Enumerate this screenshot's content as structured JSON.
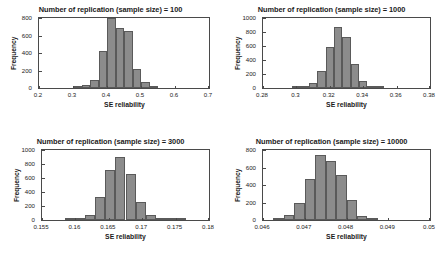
{
  "figure": {
    "panel_count": 4,
    "bar_color": "#8c8c8c",
    "bar_edge_color": "#5a5a5a",
    "axis_color": "#4a4a4a",
    "background": "#ffffff"
  },
  "chart_data": [
    {
      "type": "bar",
      "title": "Number of replication (sample size) = 100",
      "xlabel": "SE reliability",
      "ylabel": "Frequency",
      "xlim": [
        0.2,
        0.7
      ],
      "ylim": [
        0,
        800
      ],
      "grid": false,
      "legend": null,
      "xticks": [
        0.2,
        0.3,
        0.4,
        0.5,
        0.6,
        0.7
      ],
      "xticklabels": [
        "0.2",
        "0.3",
        "0.4",
        "0.5",
        "0.6",
        "0.7"
      ],
      "yticks": [
        0,
        200,
        400,
        600,
        800
      ],
      "yticklabels": [
        "0",
        "200",
        "400",
        "600",
        "800"
      ],
      "bin_edges": [
        0.3,
        0.325,
        0.35,
        0.375,
        0.4,
        0.425,
        0.45,
        0.475,
        0.5,
        0.525,
        0.55
      ],
      "values": [
        10,
        35,
        90,
        425,
        795,
        690,
        650,
        220,
        70,
        10
      ]
    },
    {
      "type": "bar",
      "title": "Number of replication (sample size) = 1000",
      "xlabel": "SE reliability",
      "ylabel": "Frequency",
      "xlim": [
        0.28,
        0.38
      ],
      "ylim": [
        0,
        1000
      ],
      "grid": false,
      "legend": null,
      "xticks": [
        0.28,
        0.3,
        0.32,
        0.34,
        0.36,
        0.38
      ],
      "xticklabels": [
        "0.28",
        "0.3",
        "0.32",
        "0.34",
        "0.36",
        "0.38"
      ],
      "yticks": [
        0,
        200,
        400,
        600,
        800,
        1000
      ],
      "yticklabels": [
        "0",
        "200",
        "400",
        "600",
        "800",
        "1000"
      ],
      "bin_edges": [
        0.2975,
        0.3025,
        0.3075,
        0.3125,
        0.3175,
        0.3225,
        0.3275,
        0.3325,
        0.3375,
        0.3425,
        0.3475,
        0.3525
      ],
      "values": [
        8,
        15,
        70,
        250,
        590,
        865,
        725,
        340,
        105,
        20,
        5
      ]
    },
    {
      "type": "bar",
      "title": "Number of replication (sample size) = 3000",
      "xlabel": "SE reliability",
      "ylabel": "Frequency",
      "xlim": [
        0.155,
        0.18
      ],
      "ylim": [
        0,
        1000
      ],
      "grid": false,
      "legend": null,
      "xticks": [
        0.155,
        0.16,
        0.165,
        0.17,
        0.175,
        0.18
      ],
      "xticklabels": [
        "0.155",
        "0.16",
        "0.165",
        "0.17",
        "0.175",
        "0.18"
      ],
      "yticks": [
        0,
        200,
        400,
        600,
        800,
        1000
      ],
      "yticklabels": [
        "0",
        "200",
        "400",
        "600",
        "800",
        "1000"
      ],
      "bin_edges": [
        0.1585,
        0.16,
        0.1615,
        0.163,
        0.1645,
        0.166,
        0.1675,
        0.169,
        0.1705,
        0.172,
        0.1735,
        0.175,
        0.1765
      ],
      "values": [
        5,
        12,
        65,
        330,
        710,
        895,
        660,
        255,
        70,
        12,
        5,
        2
      ]
    },
    {
      "type": "bar",
      "title": "Number of replication (sample size) = 10000",
      "xlabel": "SE reliability",
      "ylabel": "Frequency",
      "xlim": [
        0.046,
        0.05
      ],
      "ylim": [
        0,
        800
      ],
      "grid": false,
      "legend": null,
      "xticks": [
        0.046,
        0.047,
        0.048,
        0.049,
        0.05
      ],
      "xticklabels": [
        "0.046",
        "0.047",
        "0.048",
        "0.049",
        "0.05"
      ],
      "yticks": [
        0,
        200,
        400,
        600,
        800
      ],
      "yticklabels": [
        "0",
        "200",
        "400",
        "600",
        "800"
      ],
      "bin_edges": [
        0.04625,
        0.0465,
        0.04675,
        0.047,
        0.04725,
        0.0475,
        0.04775,
        0.048,
        0.04825,
        0.0485,
        0.04875
      ],
      "values": [
        12,
        60,
        195,
        465,
        740,
        675,
        520,
        225,
        50,
        10
      ]
    }
  ]
}
